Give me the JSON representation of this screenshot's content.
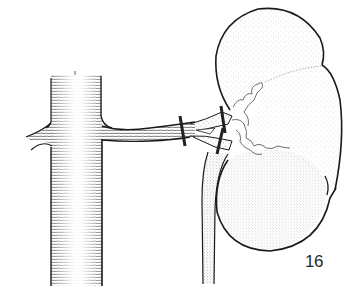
{
  "figure": {
    "number_label": "16",
    "parts": [
      "aorta",
      "aortic-side-branch",
      "renal-artery",
      "vascular-clamp-proximal",
      "vascular-clamp-upper-branch",
      "vascular-clamp-lower-branch",
      "renal-hilum-vessels",
      "kidney-upper-lobe",
      "kidney-middle-lobe",
      "kidney-lower-lobe",
      "ureter"
    ]
  },
  "colors": {
    "ink": "#1a1a1a",
    "stipple": "#555555",
    "background": "#ffffff"
  }
}
